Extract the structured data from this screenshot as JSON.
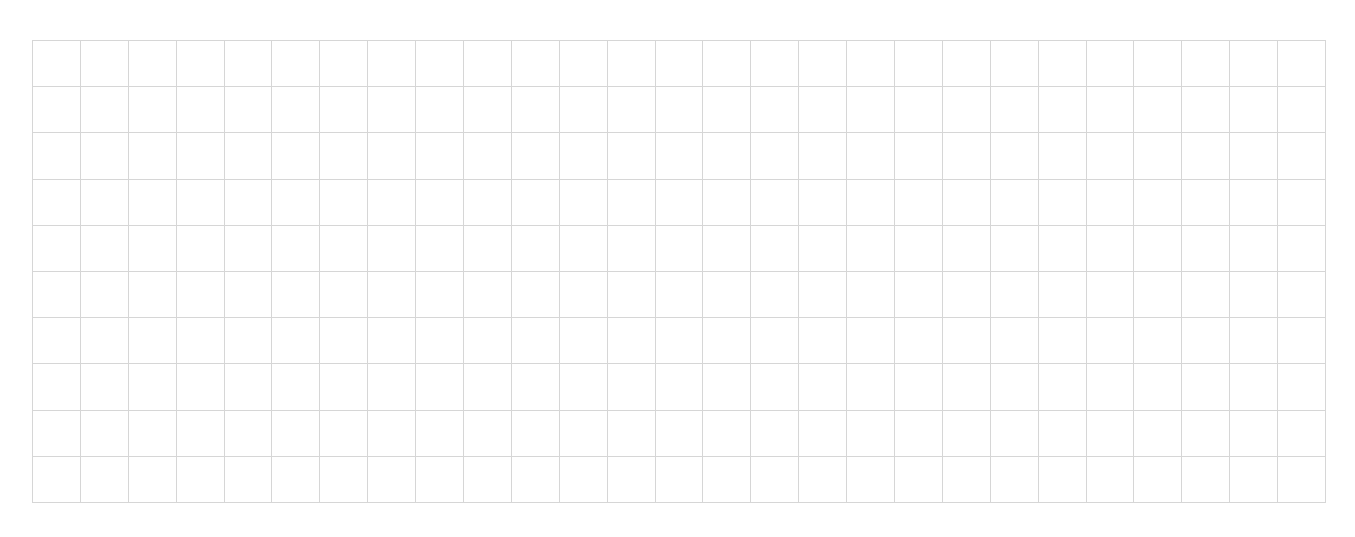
{
  "grid": {
    "columns": 27,
    "rows": 10,
    "line_color": "#d6d6d6",
    "background": "#ffffff"
  }
}
